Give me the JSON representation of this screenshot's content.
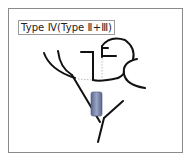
{
  "diagram": {
    "label": "Type Ⅳ(Type Ⅱ+Ⅲ)",
    "colors": {
      "frame_border": "#8a8a8a",
      "line": "#111111",
      "dotted": "#aaaaaa",
      "stent_fill": "#6f7a9e"
    }
  }
}
